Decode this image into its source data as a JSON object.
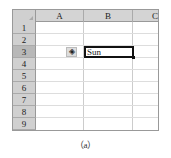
{
  "sheet": {
    "columns": [
      "A",
      "B",
      "C"
    ],
    "rows": [
      "1",
      "2",
      "3",
      "4",
      "5",
      "6",
      "7",
      "8",
      "9"
    ],
    "selected_row": "3",
    "active_cell": {
      "ref": "B3",
      "value": "Sun"
    },
    "smart_tag_icon": "◈"
  },
  "caption": "（a）"
}
